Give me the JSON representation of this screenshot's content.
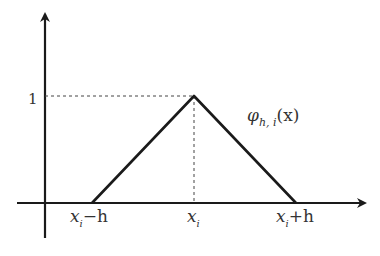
{
  "diagram": {
    "type": "hat-basis-function",
    "function_label": {
      "symbol": "φ",
      "sub": "h, i",
      "arg": "(x)"
    },
    "y_tick": "1",
    "x_ticks": [
      {
        "base": "x",
        "sub": "i",
        "suffix": "−h"
      },
      {
        "base": "x",
        "sub": "i",
        "suffix": ""
      },
      {
        "base": "x",
        "sub": "i",
        "suffix": "+h"
      }
    ],
    "colors": {
      "line": "#1a1a1a",
      "text": "#333333",
      "dashed": "#444444"
    }
  }
}
